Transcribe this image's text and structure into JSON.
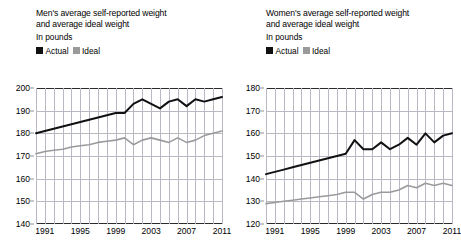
{
  "footnote": "",
  "panels": [
    {
      "id": "men",
      "title_line1": "Men's average self-reported weight",
      "title_line2": "and average ideal weight",
      "units": "In pounds",
      "legend": [
        {
          "label": "Actual",
          "color": "#111111",
          "icon": "square-swatch-actual"
        },
        {
          "label": "Ideal",
          "color": "#9a9a9a",
          "icon": "square-swatch-ideal"
        }
      ]
    },
    {
      "id": "women",
      "title_line1": "Women's average self-reported weight",
      "title_line2": "and average ideal weight",
      "units": "In pounds",
      "legend": [
        {
          "label": "Actual",
          "color": "#111111",
          "icon": "square-swatch-actual"
        },
        {
          "label": "Ideal",
          "color": "#9a9a9a",
          "icon": "square-swatch-ideal"
        }
      ]
    }
  ],
  "chart_data": [
    {
      "type": "line",
      "title": "Men's average self-reported weight and average ideal weight",
      "subtitle": "In pounds",
      "xlabel": "",
      "ylabel": "In pounds",
      "ylim": [
        140,
        200
      ],
      "yticks": [
        140,
        150,
        160,
        170,
        180,
        190,
        200
      ],
      "xlim": [
        1990,
        2011
      ],
      "xticks": [
        1991,
        1995,
        1999,
        2003,
        2007,
        2011
      ],
      "grid": true,
      "legend_position": "top-left",
      "x": [
        1990,
        1991,
        1992,
        1993,
        1994,
        1995,
        1996,
        1997,
        1998,
        1999,
        2000,
        2001,
        2002,
        2003,
        2004,
        2005,
        2006,
        2007,
        2008,
        2009,
        2010,
        2011
      ],
      "series": [
        {
          "name": "Actual",
          "color": "#111111",
          "values": [
            180,
            181,
            182,
            183,
            184,
            185,
            186,
            187,
            188,
            189,
            189,
            193,
            195,
            193,
            191,
            194,
            195,
            192,
            195,
            194,
            195,
            196
          ]
        },
        {
          "name": "Ideal",
          "color": "#9a9a9a",
          "values": [
            171,
            172,
            172.5,
            173,
            174,
            174.5,
            175,
            176,
            176.5,
            177,
            178,
            175,
            177,
            178,
            177,
            176,
            178,
            176,
            177,
            179,
            180,
            181
          ]
        }
      ]
    },
    {
      "type": "line",
      "title": "Women's average self-reported weight and average ideal weight",
      "subtitle": "In pounds",
      "xlabel": "",
      "ylabel": "In pounds",
      "ylim": [
        120,
        180
      ],
      "yticks": [
        120,
        130,
        140,
        150,
        160,
        170,
        180
      ],
      "xlim": [
        1990,
        2011
      ],
      "xticks": [
        1991,
        1995,
        1999,
        2003,
        2007,
        2011
      ],
      "grid": true,
      "legend_position": "top-left",
      "x": [
        1990,
        1991,
        1992,
        1993,
        1994,
        1995,
        1996,
        1997,
        1998,
        1999,
        2000,
        2001,
        2002,
        2003,
        2004,
        2005,
        2006,
        2007,
        2008,
        2009,
        2010,
        2011
      ],
      "series": [
        {
          "name": "Actual",
          "color": "#111111",
          "values": [
            142,
            143,
            144,
            145,
            146,
            147,
            148,
            149,
            150,
            151,
            157,
            153,
            153,
            156,
            153,
            155,
            158,
            155,
            160,
            156,
            159,
            160
          ]
        },
        {
          "name": "Ideal",
          "color": "#9a9a9a",
          "values": [
            129,
            129.5,
            130,
            130.5,
            131,
            131.5,
            132,
            132.5,
            133,
            134,
            134,
            131,
            133,
            134,
            134,
            135,
            137,
            136,
            138,
            137,
            138,
            137
          ]
        }
      ]
    }
  ]
}
